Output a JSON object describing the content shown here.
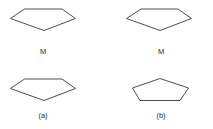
{
  "figure": {
    "background_color": "#ffffff",
    "stroke_color": "#3a3a3a",
    "stroke_width": 0.9,
    "text_color": "#2b2b2b",
    "panels": [
      {
        "id": "top-left",
        "shape_name": "pentagon-flattened-apex-down",
        "label": "M",
        "points": "24.5,9 62,9 75.5,18.5 44,30.5 10.5,18.5"
      },
      {
        "id": "top-right",
        "shape_name": "pentagon-flattened-apex-down",
        "label": "M",
        "points": "141,9 178,9 191.5,18.5 160,30.5 126.5,18.5"
      },
      {
        "id": "bottom-left",
        "shape_name": "pentagon-flattened-apex-down",
        "label": "(a)",
        "points": "24.5,79 62,79 75.5,88.5 44,100.5 10.5,88.5"
      },
      {
        "id": "bottom-right",
        "shape_name": "pentagon-upright-apex-up",
        "label": "(b)",
        "points": "160,78.5 188.5,88 180,100.5 140,100.5 132.5,88"
      }
    ]
  }
}
